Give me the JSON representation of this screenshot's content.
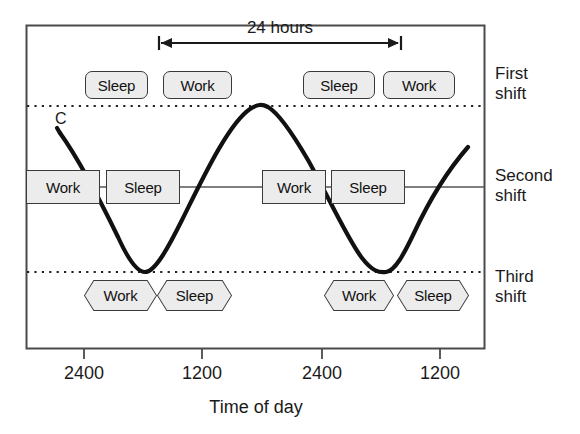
{
  "figure": {
    "title_span": "24 hours",
    "curve_label": "C",
    "axis_title": "Time of day"
  },
  "axis": {
    "ticks": [
      {
        "label": "2400",
        "x": 84
      },
      {
        "label": "1200",
        "x": 202
      },
      {
        "label": "2400",
        "x": 322
      },
      {
        "label": "1200",
        "x": 440
      }
    ]
  },
  "shifts": [
    {
      "name_line1": "First",
      "name_line2": "shift",
      "shape": "round",
      "blocks": [
        {
          "label": "Sleep",
          "x": 85,
          "w": 63
        },
        {
          "label": "Work",
          "x": 163,
          "w": 69
        },
        {
          "label": "Sleep",
          "x": 303,
          "w": 72
        },
        {
          "label": "Work",
          "x": 383,
          "w": 72
        }
      ]
    },
    {
      "name_line1": "Second",
      "name_line2": "shift",
      "shape": "square",
      "blocks": [
        {
          "label": "Work",
          "x": 26,
          "w": 74
        },
        {
          "label": "Sleep",
          "x": 106,
          "w": 74
        },
        {
          "label": "Work",
          "x": 262,
          "w": 64
        },
        {
          "label": "Sleep",
          "x": 331,
          "w": 74
        }
      ]
    },
    {
      "name_line1": "Third",
      "name_line2": "shift",
      "shape": "hex",
      "blocks": [
        {
          "label": "Work",
          "x": 85,
          "w": 71
        },
        {
          "label": "Sleep",
          "x": 158,
          "w": 73
        },
        {
          "label": "Work",
          "x": 325,
          "w": 68
        },
        {
          "label": "Sleep",
          "x": 398,
          "w": 70
        }
      ]
    }
  ],
  "chart_data": {
    "type": "line",
    "xlabel": "Time of day",
    "ylabel": "",
    "x_tick_labels": [
      "2400",
      "1200",
      "2400",
      "1200"
    ],
    "grid": false,
    "legend": "none",
    "annotations": [
      "24 hours",
      "C"
    ],
    "series": [
      {
        "name": "C",
        "description": "Circadian body-temperature rhythm, one 24-hour cycle per 2400-to-2400 span",
        "period_hours": 24,
        "peak_level": "First shift line",
        "trough_level": "Third shift line",
        "points_xy": [
          [
            60,
            133
          ],
          [
            84,
            168
          ],
          [
            110,
            218
          ],
          [
            128,
            252
          ],
          [
            145,
            272
          ],
          [
            163,
            258
          ],
          [
            185,
            215
          ],
          [
            208,
            170
          ],
          [
            235,
            128
          ],
          [
            266,
            106
          ],
          [
            292,
            125
          ],
          [
            318,
            163
          ],
          [
            344,
            213
          ],
          [
            366,
            250
          ],
          [
            385,
            272
          ],
          [
            402,
            256
          ],
          [
            423,
            215
          ],
          [
            445,
            180
          ],
          [
            468,
            148
          ]
        ]
      }
    ],
    "reference_lines": [
      {
        "label": "First shift",
        "y": 106,
        "style": "dotted"
      },
      {
        "label": "Second shift",
        "y": 187,
        "style": "solid"
      },
      {
        "label": "Third shift",
        "y": 272,
        "style": "dotted"
      }
    ]
  }
}
